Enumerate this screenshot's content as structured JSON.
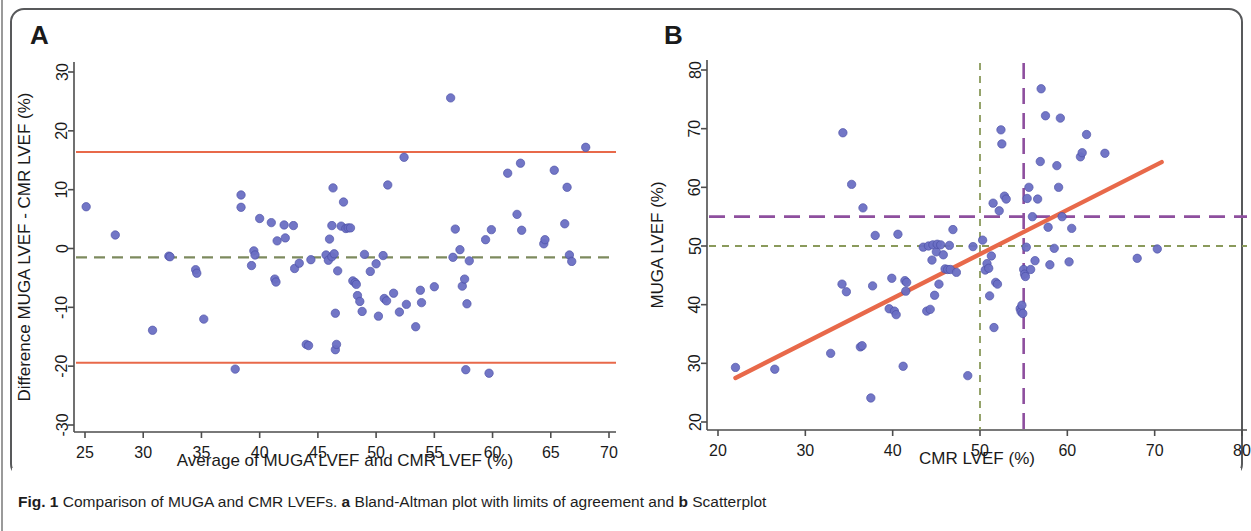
{
  "figure": {
    "number": "Fig. 1",
    "caption_main": "Comparison of MUGA and CMR LVEFs.",
    "sub_a_label": "a",
    "sub_a_text": "Bland-Altman plot with limits of agreement and",
    "sub_b_label": "b",
    "sub_b_text": "Scatterplot"
  },
  "colors": {
    "point": "#6b6fc4",
    "point_stroke": "#4b4fa6",
    "loa_line": "#e8694a",
    "regression_line": "#e8694a",
    "mean_dash": "#7d8a5e",
    "green_dash": "#8a9a5b",
    "purple_dash": "#8e4f9e",
    "axis": "#4d4d4d",
    "frame": "#58595b",
    "text": "#1a1a1a"
  },
  "panels": {
    "a": {
      "letter": "A",
      "xlabel": "Average of MUGA LVEF and CMR LVEF (%)",
      "ylabel": "Difference MUGA LVEF - CMR LVEF (%)",
      "xticks": [
        25,
        30,
        35,
        40,
        45,
        50,
        55,
        60,
        65,
        70
      ],
      "yticks": [
        -30,
        -20,
        -10,
        0,
        10,
        20,
        30
      ],
      "xlim": [
        24,
        71
      ],
      "ylim": [
        -32,
        31
      ]
    },
    "b": {
      "letter": "B",
      "xlabel": "CMR LVEF (%)",
      "ylabel": "MUGA LVEF (%)",
      "xticks": [
        20,
        30,
        40,
        50,
        60,
        70,
        80
      ],
      "yticks": [
        20,
        30,
        40,
        50,
        60,
        70,
        80
      ],
      "xlim": [
        19,
        81
      ],
      "ylim": [
        18,
        82
      ]
    }
  },
  "chart_data": [
    {
      "type": "scatter",
      "panel": "a",
      "title": "Bland-Altman plot with limits of agreement",
      "xlabel": "Average of MUGA LVEF and CMR LVEF (%)",
      "ylabel": "Difference MUGA LVEF - CMR LVEF (%)",
      "xlim": [
        24,
        71
      ],
      "ylim": [
        -32,
        31
      ],
      "grid": false,
      "legend": "none",
      "reference_lines": [
        {
          "name": "upper-limit-of-agreement",
          "orientation": "horizontal",
          "value": 16.4,
          "style": "solid",
          "color": "#e8694a"
        },
        {
          "name": "mean-difference",
          "orientation": "horizontal",
          "value": -1.5,
          "style": "dashed",
          "color": "#7d8a5e"
        },
        {
          "name": "lower-limit-of-agreement",
          "orientation": "horizontal",
          "value": -19.4,
          "style": "solid",
          "color": "#e8694a"
        }
      ],
      "points": [
        [
          25.1,
          7.1
        ],
        [
          27.6,
          2.3
        ],
        [
          30.8,
          -13.9
        ],
        [
          32.2,
          -1.3
        ],
        [
          32.3,
          -1.4
        ],
        [
          34.5,
          -3.6
        ],
        [
          34.6,
          -4.2
        ],
        [
          35.2,
          -12.0
        ],
        [
          37.9,
          -20.5
        ],
        [
          38.4,
          9.1
        ],
        [
          38.4,
          7.0
        ],
        [
          39.3,
          -2.9
        ],
        [
          39.5,
          -0.4
        ],
        [
          39.6,
          -1.1
        ],
        [
          40.0,
          5.1
        ],
        [
          41.0,
          4.4
        ],
        [
          41.3,
          -5.2
        ],
        [
          41.4,
          -5.7
        ],
        [
          41.5,
          1.3
        ],
        [
          42.1,
          4.0
        ],
        [
          42.2,
          1.8
        ],
        [
          42.9,
          3.9
        ],
        [
          43.0,
          -3.4
        ],
        [
          43.4,
          -2.5
        ],
        [
          44.0,
          -16.3
        ],
        [
          44.2,
          -16.5
        ],
        [
          44.4,
          -1.9
        ],
        [
          45.7,
          -1.1
        ],
        [
          45.9,
          -2.0
        ],
        [
          46.0,
          1.6
        ],
        [
          46.2,
          3.9
        ],
        [
          46.2,
          -1.4
        ],
        [
          46.3,
          10.3
        ],
        [
          46.4,
          -0.9
        ],
        [
          46.5,
          -11.0
        ],
        [
          46.5,
          -17.2
        ],
        [
          46.6,
          -16.3
        ],
        [
          46.7,
          -3.8
        ],
        [
          47.0,
          3.8
        ],
        [
          47.2,
          7.9
        ],
        [
          47.4,
          3.4
        ],
        [
          47.6,
          3.5
        ],
        [
          47.8,
          3.5
        ],
        [
          48.0,
          -5.5
        ],
        [
          48.2,
          -5.8
        ],
        [
          48.3,
          -6.1
        ],
        [
          48.4,
          -8.0
        ],
        [
          48.6,
          -9.0
        ],
        [
          48.8,
          -10.7
        ],
        [
          49.0,
          -1.0
        ],
        [
          49.5,
          -3.9
        ],
        [
          50.0,
          -2.6
        ],
        [
          50.2,
          -11.5
        ],
        [
          50.6,
          -1.2
        ],
        [
          50.7,
          -8.5
        ],
        [
          50.9,
          -8.9
        ],
        [
          51.0,
          10.8
        ],
        [
          51.5,
          -7.6
        ],
        [
          52.0,
          -10.8
        ],
        [
          52.4,
          15.5
        ],
        [
          52.6,
          -9.5
        ],
        [
          53.4,
          -13.3
        ],
        [
          53.8,
          -7.1
        ],
        [
          53.9,
          -9.2
        ],
        [
          55.0,
          -6.5
        ],
        [
          56.4,
          25.6
        ],
        [
          56.6,
          -1.5
        ],
        [
          56.8,
          3.3
        ],
        [
          57.2,
          -0.2
        ],
        [
          57.4,
          -6.4
        ],
        [
          57.6,
          -5.2
        ],
        [
          57.7,
          -20.6
        ],
        [
          57.8,
          -9.4
        ],
        [
          58.0,
          -2.1
        ],
        [
          59.4,
          1.5
        ],
        [
          59.7,
          -21.2
        ],
        [
          59.9,
          3.2
        ],
        [
          61.3,
          12.8
        ],
        [
          62.1,
          5.8
        ],
        [
          62.4,
          14.5
        ],
        [
          62.5,
          3.1
        ],
        [
          64.4,
          0.8
        ],
        [
          64.5,
          1.5
        ],
        [
          65.3,
          13.3
        ],
        [
          66.2,
          4.2
        ],
        [
          66.4,
          10.4
        ],
        [
          66.6,
          -1.1
        ],
        [
          66.8,
          -2.2
        ],
        [
          68.0,
          17.2
        ]
      ]
    },
    {
      "type": "scatter",
      "panel": "b",
      "title": "Scatterplot",
      "xlabel": "CMR LVEF (%)",
      "ylabel": "MUGA LVEF (%)",
      "xlim": [
        19,
        81
      ],
      "ylim": [
        18,
        82
      ],
      "grid": false,
      "legend": "none",
      "reference_lines": [
        {
          "name": "muga-threshold-55",
          "orientation": "horizontal",
          "value": 55,
          "style": "long-dashed",
          "color": "#8e4f9e"
        },
        {
          "name": "cmr-threshold-55",
          "orientation": "vertical",
          "value": 55,
          "style": "long-dashed",
          "color": "#8e4f9e"
        },
        {
          "name": "muga-threshold-50",
          "orientation": "horizontal",
          "value": 50,
          "style": "dashed",
          "color": "#8a9a5b"
        },
        {
          "name": "cmr-threshold-50",
          "orientation": "vertical",
          "value": 50,
          "style": "dashed",
          "color": "#8a9a5b"
        }
      ],
      "regression": {
        "name": "fit-line",
        "x": [
          22.0,
          70.8
        ],
        "y": [
          27.5,
          64.3
        ],
        "color": "#e8694a"
      },
      "points": [
        [
          22.0,
          29.3
        ],
        [
          26.5,
          29.0
        ],
        [
          32.9,
          31.7
        ],
        [
          34.2,
          43.5
        ],
        [
          34.3,
          69.3
        ],
        [
          34.7,
          42.2
        ],
        [
          35.3,
          60.5
        ],
        [
          36.3,
          32.8
        ],
        [
          36.5,
          33.0
        ],
        [
          36.6,
          56.5
        ],
        [
          37.5,
          24.1
        ],
        [
          37.7,
          43.2
        ],
        [
          38.0,
          51.8
        ],
        [
          39.6,
          39.3
        ],
        [
          39.9,
          44.5
        ],
        [
          40.2,
          38.9
        ],
        [
          40.4,
          38.3
        ],
        [
          40.6,
          52.0
        ],
        [
          41.2,
          29.5
        ],
        [
          41.4,
          44.1
        ],
        [
          41.5,
          42.3
        ],
        [
          41.6,
          43.8
        ],
        [
          43.5,
          49.8
        ],
        [
          43.9,
          38.9
        ],
        [
          44.1,
          50.0
        ],
        [
          44.3,
          39.2
        ],
        [
          44.5,
          47.6
        ],
        [
          44.6,
          50.2
        ],
        [
          44.8,
          41.6
        ],
        [
          45.0,
          49.0
        ],
        [
          45.1,
          50.3
        ],
        [
          45.3,
          43.5
        ],
        [
          45.5,
          50.2
        ],
        [
          45.8,
          48.5
        ],
        [
          46.0,
          46.1
        ],
        [
          46.3,
          46.0
        ],
        [
          46.5,
          50.1
        ],
        [
          46.6,
          46.0
        ],
        [
          46.9,
          52.8
        ],
        [
          47.3,
          45.5
        ],
        [
          48.6,
          27.9
        ],
        [
          49.2,
          49.9
        ],
        [
          50.3,
          51.0
        ],
        [
          50.6,
          45.9
        ],
        [
          50.8,
          47.0
        ],
        [
          51.0,
          46.2
        ],
        [
          51.1,
          41.5
        ],
        [
          51.3,
          48.3
        ],
        [
          51.5,
          57.3
        ],
        [
          51.6,
          36.1
        ],
        [
          51.8,
          43.8
        ],
        [
          52.0,
          43.5
        ],
        [
          52.2,
          56.0
        ],
        [
          52.4,
          69.8
        ],
        [
          52.5,
          67.4
        ],
        [
          52.8,
          58.5
        ],
        [
          53.0,
          58.0
        ],
        [
          54.6,
          39.3
        ],
        [
          54.7,
          38.8
        ],
        [
          54.8,
          39.9
        ],
        [
          54.9,
          38.5
        ],
        [
          55.0,
          46.0
        ],
        [
          55.1,
          45.2
        ],
        [
          55.2,
          44.8
        ],
        [
          55.3,
          49.8
        ],
        [
          55.4,
          58.1
        ],
        [
          55.6,
          60.0
        ],
        [
          55.8,
          46.0
        ],
        [
          56.0,
          55.0
        ],
        [
          56.3,
          47.5
        ],
        [
          56.6,
          58.0
        ],
        [
          56.9,
          64.4
        ],
        [
          57.0,
          76.8
        ],
        [
          57.5,
          72.2
        ],
        [
          57.8,
          53.2
        ],
        [
          58.0,
          46.8
        ],
        [
          58.5,
          49.6
        ],
        [
          58.8,
          63.7
        ],
        [
          59.0,
          60.0
        ],
        [
          59.2,
          71.8
        ],
        [
          59.4,
          55.0
        ],
        [
          60.2,
          47.3
        ],
        [
          60.5,
          53.0
        ],
        [
          61.5,
          65.2
        ],
        [
          61.7,
          65.9
        ],
        [
          62.2,
          69.0
        ],
        [
          64.3,
          65.8
        ],
        [
          68.0,
          47.9
        ],
        [
          70.3,
          49.5
        ]
      ]
    }
  ]
}
